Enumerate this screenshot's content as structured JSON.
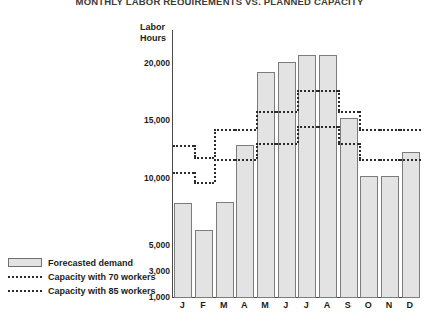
{
  "title": "MONTHLY LABOR REQUIREMENTS VS. PLANNED CAPACITY",
  "axis_title_line1": "Labor",
  "axis_title_line2": "Hours",
  "legend": [
    {
      "label": "Forecasted demand",
      "swatch": "bar-swatch"
    },
    {
      "label": "Capacity with 70 workers",
      "swatch": "dotted-swatch"
    },
    {
      "label": "Capacity with 85 workers",
      "swatch": "dotted-swatch"
    }
  ],
  "colors": {
    "bar_fill": "#e3e3e3",
    "bar_stroke": "#7c7c7c",
    "dotted_line": "#2b2b2b",
    "axis": "#4a4a4a",
    "text": "#1c1c1c"
  },
  "chart_data": {
    "type": "bar",
    "title": "MONTHLY LABOR REQUIREMENTS VS. PLANNED CAPACITY",
    "xlabel": "",
    "ylabel": "Labor Hours",
    "grid": false,
    "legend_position": "bottom-left",
    "categories": [
      "J",
      "F",
      "M",
      "A",
      "M",
      "J",
      "J",
      "A",
      "S",
      "O",
      "N",
      "D"
    ],
    "month_names": [
      "January",
      "February",
      "March",
      "April",
      "May",
      "June",
      "July",
      "August",
      "September",
      "October",
      "November",
      "December"
    ],
    "ytick_labels": [
      "20,000",
      "15,000",
      "10,000",
      "5,000",
      "3,000",
      "1,000"
    ],
    "ytick_values": [
      20000,
      15000,
      10000,
      5000,
      3000,
      1000
    ],
    "ylim": [
      1000,
      22500
    ],
    "series": [
      {
        "name": "Forecasted demand",
        "type": "bar",
        "values": [
          8200,
          6200,
          8300,
          12900,
          19300,
          20300,
          21400,
          21400,
          15300,
          10300,
          10300,
          12300
        ]
      },
      {
        "name": "Capacity with 70 workers",
        "type": "step",
        "values": [
          10600,
          9800,
          11700,
          11700,
          13100,
          13100,
          14600,
          14600,
          13100,
          11700,
          11700,
          11700
        ]
      },
      {
        "name": "Capacity with 85 workers",
        "type": "step",
        "values": [
          12900,
          11900,
          14300,
          14300,
          15900,
          15900,
          17700,
          17700,
          15900,
          14300,
          14300,
          14300
        ]
      }
    ]
  }
}
